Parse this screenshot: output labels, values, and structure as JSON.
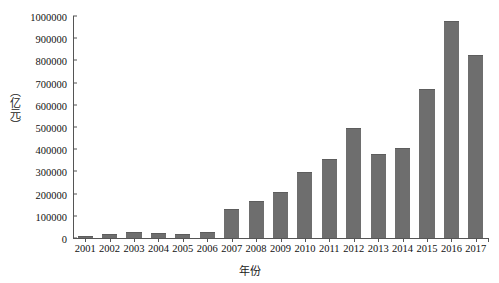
{
  "chart_data": {
    "type": "bar",
    "title": "",
    "xlabel": "年份",
    "ylabel": "（亿元）",
    "categories": [
      "2001",
      "2002",
      "2003",
      "2004",
      "2005",
      "2006",
      "2007",
      "2008",
      "2009",
      "2010",
      "2011",
      "2012",
      "2013",
      "2014",
      "2015",
      "2016",
      "2017"
    ],
    "values": [
      6000,
      14000,
      24000,
      16000,
      14000,
      22000,
      125000,
      160000,
      205000,
      295000,
      350000,
      490000,
      375000,
      400000,
      665000,
      975000,
      820000
    ],
    "ylim": [
      0,
      1000000
    ],
    "yticks": [
      "0",
      "100000",
      "200000",
      "300000",
      "400000",
      "500000",
      "600000",
      "700000",
      "800000",
      "900000",
      "1000000"
    ],
    "ytick_values": [
      0,
      100000,
      200000,
      300000,
      400000,
      500000,
      600000,
      700000,
      800000,
      900000,
      1000000
    ],
    "grid": false,
    "legend": null,
    "bar_color": "#6e6e6e",
    "axis_color": "#555555"
  }
}
